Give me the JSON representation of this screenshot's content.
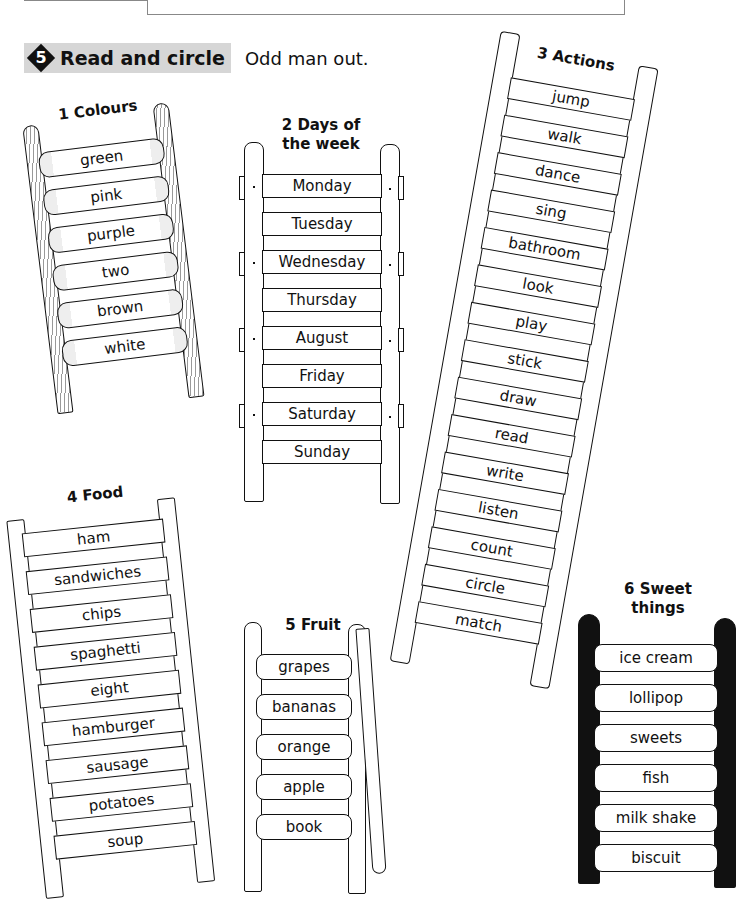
{
  "exercise": {
    "number": "5",
    "title": "Read and circle",
    "instruction": "Odd man out."
  },
  "ladders": [
    {
      "title": "1 Colours",
      "words": [
        "green",
        "pink",
        "purple",
        "two",
        "brown",
        "white"
      ]
    },
    {
      "title_line1": "2 Days of",
      "title_line2": "the week",
      "words": [
        "Monday",
        "Tuesday",
        "Wednesday",
        "Thursday",
        "August",
        "Friday",
        "Saturday",
        "Sunday"
      ]
    },
    {
      "title": "3 Actions",
      "words": [
        "jump",
        "walk",
        "dance",
        "sing",
        "bathroom",
        "look",
        "play",
        "stick",
        "draw",
        "read",
        "write",
        "listen",
        "count",
        "circle",
        "match"
      ]
    },
    {
      "title": "4 Food",
      "words": [
        "ham",
        "sandwiches",
        "chips",
        "spaghetti",
        "eight",
        "hamburger",
        "sausage",
        "potatoes",
        "soup"
      ]
    },
    {
      "title": "5 Fruit",
      "words": [
        "grapes",
        "bananas",
        "orange",
        "apple",
        "book"
      ]
    },
    {
      "title_line1": "6 Sweet",
      "title_line2": "things",
      "words": [
        "ice cream",
        "lollipop",
        "sweets",
        "fish",
        "milk shake",
        "biscuit"
      ]
    }
  ]
}
